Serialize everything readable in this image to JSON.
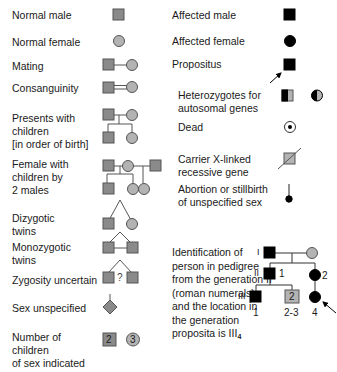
{
  "colors": {
    "normal_fill": "#8a8a8a",
    "female_fill": "#b3b3b3",
    "affected": "#000000",
    "line": "#555555"
  },
  "left_column": [
    {
      "id": "normal-male",
      "label": "Normal male"
    },
    {
      "id": "normal-female",
      "label": "Normal female"
    },
    {
      "id": "mating",
      "label": "Mating"
    },
    {
      "id": "consanguinity",
      "label": "Consanguinity"
    },
    {
      "id": "presents-children",
      "label": "Presents with\nchildren\n[in order of birth]"
    },
    {
      "id": "female-two-males",
      "label": "Female with\nchildren by\n2 males"
    },
    {
      "id": "dizygotic",
      "label": "Dizygotic\ntwins"
    },
    {
      "id": "monozygotic",
      "label": "Monozygotic\ntwins"
    },
    {
      "id": "zygosity-uncertain",
      "label": "Zygosity uncertain",
      "symbol_text": "?"
    },
    {
      "id": "sex-unspecified",
      "label": "Sex unspecified"
    },
    {
      "id": "number-children",
      "label": "Number of\nchildren\nof sex indicated",
      "male_count": "2",
      "female_count": "3"
    }
  ],
  "right_column": [
    {
      "id": "affected-male",
      "label": "Affected male"
    },
    {
      "id": "affected-female",
      "label": "Affected female"
    },
    {
      "id": "propositus",
      "label": "Propositus"
    },
    {
      "id": "heterozygotes",
      "label": "Heterozygotes for\nautosomal genes"
    },
    {
      "id": "dead",
      "label": "Dead"
    },
    {
      "id": "carrier-x",
      "label": "Carrier X-linked\nrecessive gene"
    },
    {
      "id": "abortion",
      "label": "Abortion or stillbirth\nof unspecified sex"
    }
  ],
  "identification": {
    "text": "Identification of\nperson in pedigree\nfrom the generation II\n(roman numerals)\nand the location in\nthe generation\nproposita is III",
    "subscript": "4",
    "pedigree": {
      "gen_labels": [
        "I",
        "II",
        "III"
      ],
      "gen2_numbers": [
        "1",
        "2"
      ],
      "gen3_numbers": [
        "1",
        "2-3",
        "4"
      ],
      "box_count": "2"
    }
  }
}
